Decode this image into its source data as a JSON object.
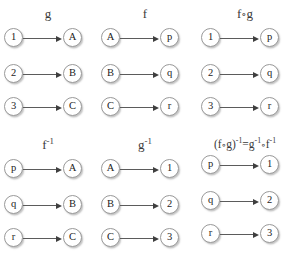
{
  "figure": {
    "title_text": "Function composition and inverse diagrams",
    "background_color": "#ffffff",
    "node_fill": "#ffffff",
    "node_border": "#9a9a9a",
    "arrow_color": "#5b5b5b",
    "label_color": "#3a3a3a"
  },
  "panels": [
    {
      "id": "g",
      "label": "g",
      "label_html": "g",
      "mappings": [
        {
          "from": "1",
          "to": "A"
        },
        {
          "from": "2",
          "to": "B"
        },
        {
          "from": "3",
          "to": "C"
        }
      ]
    },
    {
      "id": "f",
      "label": "f",
      "label_html": "f",
      "mappings": [
        {
          "from": "A",
          "to": "p"
        },
        {
          "from": "B",
          "to": "q"
        },
        {
          "from": "C",
          "to": "r"
        }
      ]
    },
    {
      "id": "f-compose-g",
      "label": "f∘g",
      "label_html": "f<span class=\"ring\">∘</span>g",
      "mappings": [
        {
          "from": "1",
          "to": "p"
        },
        {
          "from": "2",
          "to": "q"
        },
        {
          "from": "3",
          "to": "r"
        }
      ]
    },
    {
      "id": "f-inverse",
      "label": "f⁻¹",
      "label_html": "f<sup>-1</sup>",
      "mappings": [
        {
          "from": "p",
          "to": "A"
        },
        {
          "from": "q",
          "to": "B"
        },
        {
          "from": "r",
          "to": "C"
        }
      ]
    },
    {
      "id": "g-inverse",
      "label": "g⁻¹",
      "label_html": "g<sup>-1</sup>",
      "mappings": [
        {
          "from": "A",
          "to": "1"
        },
        {
          "from": "B",
          "to": "2"
        },
        {
          "from": "C",
          "to": "3"
        }
      ]
    },
    {
      "id": "f-compose-g-inverse",
      "label": "(f∘g)⁻¹=g⁻¹∘f⁻¹",
      "label_html": "(f<span class=\"ring\">∘</span>g)<sup>-1</sup>=g<sup>-1</sup><span class=\"ring\">∘</span>f<sup>-1</sup>",
      "mappings": [
        {
          "from": "p",
          "to": "1"
        },
        {
          "from": "q",
          "to": "2"
        },
        {
          "from": "r",
          "to": "3"
        }
      ]
    }
  ]
}
